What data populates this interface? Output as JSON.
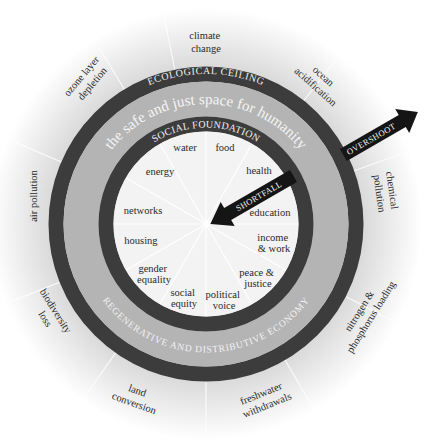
{
  "diagram": {
    "colors": {
      "ring_dark": "#3c3c3c",
      "band_light": "#b4b4b4",
      "inner_fill": "#f3f3f3",
      "halo": "#d8d8d8",
      "arrow": "#151515",
      "text": "#2a2a2a"
    },
    "rings": {
      "ecological_ceiling": "ECOLOGICAL CEILING",
      "safe_space": "the safe and just space for humanity",
      "social_foundation": "SOCIAL FOUNDATION",
      "economy": "REGENERATIVE AND DISTRIBUTIVE ECONOMY"
    },
    "arrows": {
      "overshoot": "OVERSHOOT",
      "shortfall": "SHORTFALL"
    },
    "ecological_ceiling_items": [
      {
        "line1": "climate",
        "line2": "change"
      },
      {
        "line1": "ocean",
        "line2": "acidification"
      },
      {
        "line1": "chemical",
        "line2": "pollution"
      },
      {
        "line1": "nitrogen &",
        "line2": "phosphorus loading"
      },
      {
        "line1": "freshwater",
        "line2": "withdrawals"
      },
      {
        "line1": "land",
        "line2": "conversion"
      },
      {
        "line1": "biodiversity",
        "line2": "loss"
      },
      {
        "line1": "air pollution",
        "line2": ""
      },
      {
        "line1": "ozone layer",
        "line2": "depletion"
      }
    ],
    "social_foundation_items": [
      {
        "line1": "water",
        "line2": ""
      },
      {
        "line1": "food",
        "line2": ""
      },
      {
        "line1": "health",
        "line2": ""
      },
      {
        "line1": "education",
        "line2": ""
      },
      {
        "line1": "income",
        "line2": "& work"
      },
      {
        "line1": "peace &",
        "line2": "justice"
      },
      {
        "line1": "political",
        "line2": "voice"
      },
      {
        "line1": "social",
        "line2": "equity"
      },
      {
        "line1": "gender",
        "line2": "equality"
      },
      {
        "line1": "housing",
        "line2": ""
      },
      {
        "line1": "networks",
        "line2": ""
      },
      {
        "line1": "energy",
        "line2": ""
      }
    ]
  }
}
